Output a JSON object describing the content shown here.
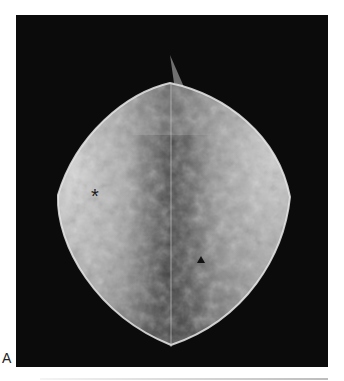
{
  "figure": {
    "panel_label": "A",
    "modality": "mammogram",
    "markers": {
      "asterisk": {
        "symbol": "*",
        "x": 98,
        "y": 196
      },
      "triangle": {
        "symbol": "▲",
        "x": 201,
        "y": 252
      }
    },
    "colors": {
      "background": "#0b0b0b",
      "tissue_bright": "#e6e6e6",
      "tissue_dark": "#5a5a5a"
    }
  }
}
